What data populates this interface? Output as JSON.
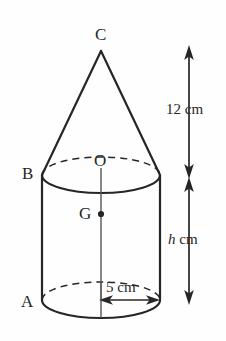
{
  "figure": {
    "background_color": "#fefefe",
    "stroke_color": "#262626"
  },
  "labels": {
    "apex": "C",
    "cylinder_top_left": "B",
    "cone_base_centre": "O",
    "centroid": "G",
    "cylinder_bottom_left": "A"
  },
  "dimensions": {
    "cone_height": "12 cm",
    "cylinder_height_value": "h",
    "cylinder_height_unit": "cm",
    "radius": "5 cm"
  },
  "geometry": {
    "cone": {
      "apex_x": 101,
      "apex_y": 51,
      "base_left_x": 42,
      "base_right_x": 160,
      "base_y": 175
    },
    "cylinder": {
      "left_x": 42,
      "right_x": 160,
      "top_y": 175,
      "bottom_y": 300,
      "ellipse_rx": 59,
      "ellipse_ry": 18,
      "axis_x": 101
    },
    "centroid_point": {
      "x": 101,
      "y": 214
    },
    "dimension_line_x": 189,
    "radius_arrow_y": 300
  }
}
